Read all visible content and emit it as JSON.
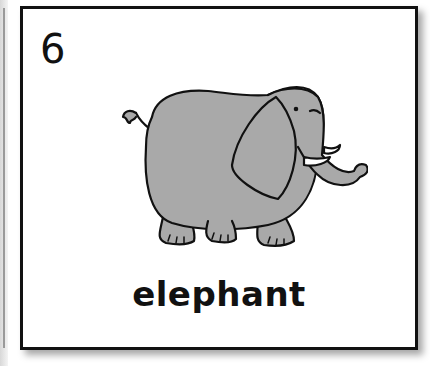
{
  "card": {
    "number": "6",
    "word": "elephant",
    "illustration": "elephant-illustration"
  },
  "colors": {
    "border": "#111111",
    "elephant_fill": "#a9a9a9",
    "background": "#ffffff"
  }
}
